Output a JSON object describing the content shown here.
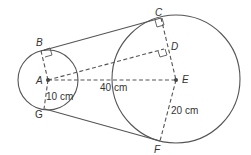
{
  "diagram": {
    "type": "two circles with external common tangents",
    "points": {
      "A": "A",
      "B": "B",
      "C": "C",
      "D": "D",
      "E": "E",
      "F": "F",
      "G": "G"
    },
    "measurements": {
      "small_radius": "10 cm",
      "center_distance": "40 cm",
      "large_radius": "20 cm"
    },
    "segments": [
      "BC",
      "GF",
      "AB",
      "AG",
      "AE",
      "AD",
      "CE",
      "EF"
    ],
    "right_angles": [
      "B",
      "C",
      "D"
    ]
  }
}
